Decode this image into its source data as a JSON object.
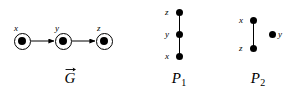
{
  "figure": {
    "background": "#ffffff",
    "foreground": "#000000",
    "width": 298,
    "height": 99
  },
  "panels": [
    {
      "id": "graph-g",
      "caption": "G",
      "caption_accent": "vector-arrow",
      "node_style": "circled-filled-dot",
      "orientation": "horizontal",
      "nodes": [
        {
          "id": "x",
          "label": "x",
          "cx": 22,
          "cy": 41,
          "label_x": 14,
          "label_y": 24
        },
        {
          "id": "y",
          "label": "y",
          "cx": 63,
          "cy": 41,
          "label_x": 55,
          "label_y": 24
        },
        {
          "id": "z",
          "label": "z",
          "cx": 104,
          "cy": 41,
          "label_x": 97,
          "label_y": 24
        }
      ],
      "edges": [
        {
          "from": "x",
          "to": "y",
          "directed": true
        },
        {
          "from": "y",
          "to": "z",
          "directed": true
        }
      ],
      "caption_x": 57,
      "caption_y": 71
    },
    {
      "id": "poset-p1",
      "caption": "P",
      "caption_sub": "1",
      "node_style": "filled-dot",
      "orientation": "vertical",
      "nodes": [
        {
          "id": "z",
          "label": "z",
          "cx": 39,
          "cy": 12,
          "label_x": 25,
          "label_y": 8
        },
        {
          "id": "y",
          "label": "y",
          "cx": 39,
          "cy": 34,
          "label_x": 25,
          "label_y": 30
        },
        {
          "id": "x",
          "label": "x",
          "cx": 39,
          "cy": 56,
          "label_x": 25,
          "label_y": 52
        }
      ],
      "edges": [
        {
          "from": "x",
          "to": "y",
          "directed": false
        },
        {
          "from": "y",
          "to": "z",
          "directed": false
        }
      ],
      "caption_x": 39,
      "caption_y": 71
    },
    {
      "id": "poset-p2",
      "caption": "P",
      "caption_sub": "2",
      "node_style": "filled-dot",
      "orientation": "vertical",
      "nodes": [
        {
          "id": "x",
          "label": "x",
          "cx": 35,
          "cy": 20,
          "label_x": 21,
          "label_y": 16
        },
        {
          "id": "z",
          "label": "z",
          "cx": 35,
          "cy": 48,
          "label_x": 21,
          "label_y": 44
        },
        {
          "id": "y",
          "label": "y",
          "cx": 54,
          "cy": 34,
          "label_x": 60,
          "label_y": 30
        }
      ],
      "edges": [
        {
          "from": "z",
          "to": "x",
          "directed": false
        }
      ],
      "caption_x": 41,
      "caption_y": 71
    }
  ],
  "labels": {
    "g_node_x": "x",
    "g_node_y": "y",
    "g_node_z": "z",
    "g_caption": "G",
    "p1_node_top": "z",
    "p1_node_mid": "y",
    "p1_node_bot": "x",
    "p1_caption": "P",
    "p1_caption_sub": "1",
    "p2_node_top": "x",
    "p2_node_bot": "z",
    "p2_node_iso": "y",
    "p2_caption": "P",
    "p2_caption_sub": "2"
  }
}
